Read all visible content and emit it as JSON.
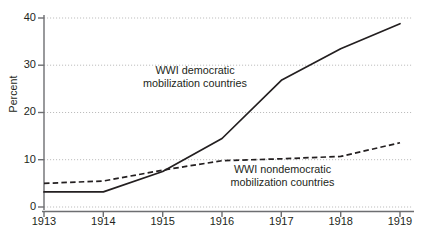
{
  "chart_data": {
    "type": "line",
    "title": "",
    "xlabel": "",
    "ylabel": "Percent",
    "x": [
      1913,
      1914,
      1915,
      1916,
      1917,
      1918,
      1919
    ],
    "xticklabels": [
      "1913",
      "1914",
      "1915",
      "1916",
      "1917",
      "1918",
      "1919"
    ],
    "yticks": [
      0,
      10,
      20,
      30,
      40
    ],
    "yticklabels": [
      "0",
      "10",
      "20",
      "30",
      "40"
    ],
    "ylim": [
      0,
      40
    ],
    "xlim": [
      1913,
      1919
    ],
    "grid": "horizontal-dotted",
    "legend": "inline-annotations",
    "series": [
      {
        "name": "WWI democratic mobilization countries",
        "style": "solid",
        "color": "#231f20",
        "values": [
          3.2,
          3.2,
          7.5,
          14.5,
          26.8,
          33.5,
          38.8
        ],
        "annotation_line1": "WWI democratic",
        "annotation_line2": "mobilization countries"
      },
      {
        "name": "WWI nondemocratic mobilization countries",
        "style": "dashed",
        "color": "#231f20",
        "values": [
          5.0,
          5.5,
          7.8,
          9.8,
          10.2,
          10.7,
          13.6
        ],
        "annotation_line1": "WWI nondemocratic",
        "annotation_line2": "mobilization countries"
      }
    ]
  },
  "axes": {
    "y_label": "Percent",
    "y_ticks": [
      "0",
      "10",
      "20",
      "30",
      "40"
    ],
    "x_ticks": [
      "1913",
      "1914",
      "1915",
      "1916",
      "1917",
      "1918",
      "1919"
    ]
  },
  "annotations": {
    "democratic": {
      "line1": "WWI democratic",
      "line2": "mobilization countries"
    },
    "nondemocratic": {
      "line1": "WWI nondemocratic",
      "line2": "mobilization countries"
    }
  },
  "colors": {
    "line": "#231f20",
    "grid": "#b8b8b8",
    "axis": "#58595b",
    "background": "#ffffff"
  }
}
